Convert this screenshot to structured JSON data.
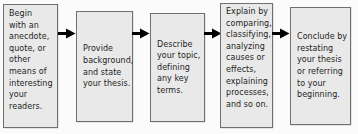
{
  "diagram": {
    "background_color": "#fbfbfb",
    "box_fill_color": "#e9e9e9",
    "box_border_color": "#6f6f6f",
    "text_color": "#1e1e1e",
    "arrow_color": "#000000",
    "steps": [
      {
        "id": "step-1",
        "text": "Begin\nwith an\nanecdote,\nquote, or\nother\nmeans of\ninteresting\nyour\nreaders."
      },
      {
        "id": "step-2",
        "text": "Provide\nbackground,\nand state\nyour thesis."
      },
      {
        "id": "step-3",
        "text": "Describe\nyour topic,\ndefining\nany key\nterms."
      },
      {
        "id": "step-4",
        "text": "Explain by\ncomparing,\nclassifying,\nanalyzing\ncauses or\neffects,\nexplaining\nprocesses,\nand so on."
      },
      {
        "id": "step-5",
        "text": "Conclude by\nrestating\nyour thesis\nor referring\nto your\nbeginning."
      }
    ],
    "connectors": [
      {
        "id": "connector-1",
        "icon": "arrow-right-icon",
        "from": "step-1",
        "to": "step-2"
      },
      {
        "id": "connector-2",
        "icon": "arrow-right-icon",
        "from": "step-2",
        "to": "step-3"
      },
      {
        "id": "connector-3",
        "icon": "arrow-right-icon",
        "from": "step-3",
        "to": "step-4"
      },
      {
        "id": "connector-4",
        "icon": "arrow-right-icon",
        "from": "step-4",
        "to": "step-5"
      }
    ]
  }
}
